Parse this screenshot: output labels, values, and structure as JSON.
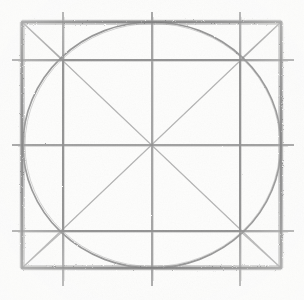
{
  "artwork": {
    "title": "Squared Circle Construction",
    "medium": "graphite pencil on paper",
    "description": "Freehand geometric construction: an outer square with an inscribed circle, an inner square joining the circle's oblique tangent nodes, full diagonals, a centred cross of grid lines, and short diagonals in each corner.",
    "alt_text": "Hand drawn pencil diagram of a square containing an inscribed circle, an inner square, crossing diagonals and grid lines."
  },
  "canvas": {
    "width": 304,
    "height": 300,
    "background_color": "#fdfdfc",
    "ink_color": "#8a8a8a",
    "frame_color": "#7d7d7d",
    "faint_color": "#b6b6b6"
  },
  "geometry": {
    "outer_square": {
      "label": "Outer square",
      "left": 22,
      "top": 22,
      "right": 281,
      "bottom": 268,
      "width": 259,
      "height": 246,
      "stroke_weight": "heavy"
    },
    "inscribed_circle": {
      "label": "Inscribed circle",
      "center_x": 152,
      "center_y": 145,
      "radius_x": 129,
      "radius_y": 123,
      "stroke_weight": "medium"
    },
    "inner_square": {
      "label": "Inner square",
      "left": 63,
      "top": 60,
      "right": 240,
      "bottom": 231,
      "width": 177,
      "height": 171,
      "stroke_weight": "medium"
    },
    "center_point": {
      "label": "Centre",
      "x": 152,
      "y": 145
    },
    "nodes": [
      {
        "name": "node-top-left",
        "x": 63,
        "y": 60
      },
      {
        "name": "node-top-right",
        "x": 240,
        "y": 60
      },
      {
        "name": "node-bottom-left",
        "x": 63,
        "y": 231
      },
      {
        "name": "node-bottom-right",
        "x": 240,
        "y": 231
      }
    ],
    "grid_lines": {
      "verticals": [
        63,
        152,
        240
      ],
      "horizontals": [
        60,
        145,
        231
      ],
      "vertical_extent": {
        "start": 12,
        "end": 286
      },
      "horizontal_extent": {
        "start": 12,
        "end": 294
      }
    },
    "diagonals": [
      {
        "name": "diagonal-tl-br",
        "x1": 22,
        "y1": 22,
        "x2": 281,
        "y2": 268,
        "weight": "faint"
      },
      {
        "name": "diagonal-tr-bl",
        "x1": 281,
        "y1": 22,
        "x2": 22,
        "y2": 268,
        "weight": "faint"
      }
    ],
    "corner_diagonals": [
      {
        "name": "corner-diagonal-top-left",
        "x1": 22,
        "y1": 22,
        "x2": 63,
        "y2": 60
      },
      {
        "name": "corner-diagonal-top-right",
        "x1": 281,
        "y1": 22,
        "x2": 240,
        "y2": 60
      },
      {
        "name": "corner-diagonal-bottom-left",
        "x1": 22,
        "y1": 268,
        "x2": 63,
        "y2": 231
      },
      {
        "name": "corner-diagonal-bottom-right",
        "x1": 281,
        "y1": 268,
        "x2": 240,
        "y2": 231
      }
    ]
  }
}
